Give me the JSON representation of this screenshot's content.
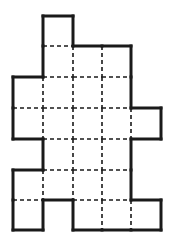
{
  "figure": {
    "type": "grid-polyomino",
    "cell_size": 30,
    "origin": [
      13,
      16
    ],
    "col_edges": [
      13,
      43,
      73,
      102,
      131,
      161
    ],
    "row_edges": [
      16,
      46,
      77,
      108,
      139,
      170,
      200,
      230
    ],
    "rows": [
      [
        1
      ],
      [
        1,
        2,
        3
      ],
      [
        0,
        1,
        2,
        3
      ],
      [
        0,
        1,
        2,
        3,
        4
      ],
      [
        1,
        2,
        3
      ],
      [
        0,
        1,
        2,
        3
      ],
      [
        0,
        2,
        3,
        4
      ]
    ],
    "cell_count": 24,
    "colors": {
      "outline": "#1a1a1a",
      "dashed": "#1a1a1a",
      "fill": "#ffffff"
    }
  }
}
